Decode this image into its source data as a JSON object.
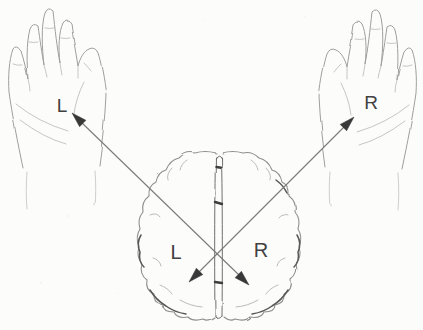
{
  "figure": {
    "kind": "anatomical-diagram",
    "labels": {
      "left_hand": "L",
      "right_hand": "R",
      "left_hemisphere": "L",
      "right_hemisphere": "R"
    },
    "elements": [
      "left-hand",
      "right-hand",
      "brain-top-view"
    ],
    "connections": [
      {
        "from": "right-hemisphere",
        "to": "left-hand",
        "style": "double-headed-arrow"
      },
      {
        "from": "left-hemisphere",
        "to": "right-hand",
        "style": "double-headed-arrow"
      }
    ],
    "colors": {
      "background": "#fcfcfb",
      "sketch_line": "#9e9e9e",
      "brain_line": "#8f8f8f",
      "arrow_line": "#7a7a7a",
      "arrow_head": "#383838",
      "label_ink": "#414141"
    }
  }
}
